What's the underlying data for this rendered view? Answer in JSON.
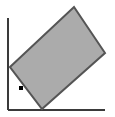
{
  "figure": {
    "title": "Inclined rectangular block resting on axes",
    "canvas": {
      "width": 115,
      "height": 117,
      "background_color": "#ffffff"
    },
    "colors": {
      "shape_fill": "#ababab",
      "shape_stroke": "#555555",
      "axis_color": "#3a3a3a",
      "marker_color": "#000000"
    },
    "axes": {
      "label": "L-shaped axis frame",
      "origin_x": 8,
      "origin_y": 110,
      "vertical": {
        "name": "vertical-axis",
        "x": 8,
        "y_top": 18,
        "y_bottom": 110,
        "stroke_width": 2
      },
      "horizontal": {
        "name": "horizontal-axis",
        "y": 110,
        "x_left": 8,
        "x_right": 105,
        "stroke_width": 2
      }
    },
    "shape": {
      "name": "tilted-rectangle",
      "type": "rectangle",
      "stroke_width": 2,
      "fill": "#ababab",
      "stroke": "#555555",
      "vertices": [
        {
          "label": "left",
          "x": 10,
          "y": 67
        },
        {
          "label": "top",
          "x": 74,
          "y": 7
        },
        {
          "label": "right",
          "x": 105,
          "y": 53
        },
        {
          "label": "bottom",
          "x": 42,
          "y": 109
        }
      ],
      "points_string": "10,67 74,7 105,53 42,109"
    },
    "marker": {
      "name": "point-marker",
      "shape": "square",
      "x": 21,
      "y": 88,
      "size": 4,
      "color": "#000000"
    }
  }
}
